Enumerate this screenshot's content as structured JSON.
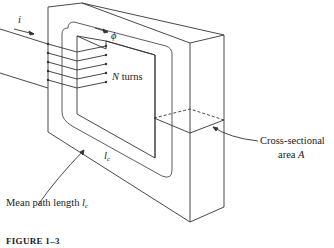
{
  "figure": {
    "caption": "FIGURE 1–3"
  },
  "labels": {
    "current": "i",
    "flux": "ϕ",
    "turns_var": "N",
    "turns_text": " turns",
    "cross_section_line1": "Cross-sectional",
    "cross_section_line2_text": "area ",
    "cross_section_var": "A",
    "core_length_main": "l",
    "core_length_sub": "c",
    "mean_path_text": "Mean path length ",
    "mean_path_var": "l",
    "mean_path_sub": "c"
  },
  "diagram": {
    "coil_turns_drawn": 5,
    "stroke_color": "#333333"
  }
}
